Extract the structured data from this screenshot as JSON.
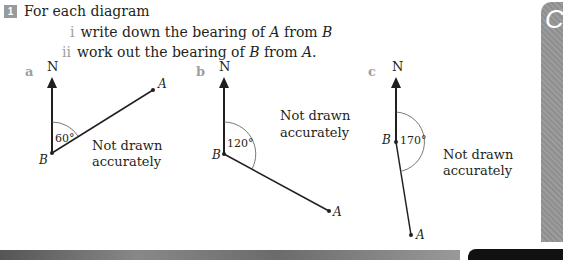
{
  "question": {
    "number": "1",
    "intro": "For each diagram",
    "parts": [
      {
        "label": "i",
        "text_before": "write down the bearing of ",
        "var1": "A",
        "text_mid": " from ",
        "var2": "B",
        "text_after": ""
      },
      {
        "label": "ii",
        "text_before": "work out the bearing of ",
        "var1": "B",
        "text_mid": " from ",
        "var2": "A",
        "text_after": "."
      }
    ]
  },
  "diagrams": [
    {
      "label": "a",
      "north": "N",
      "angle": "60°",
      "point_b": "B",
      "point_a": "A",
      "note_line1": "Not drawn",
      "note_line2": "accurately"
    },
    {
      "label": "b",
      "north": "N",
      "angle": "120°",
      "point_b": "B",
      "point_a": "A",
      "note_line1": "Not drawn",
      "note_line2": "accurately"
    },
    {
      "label": "c",
      "north": "N",
      "angle": "170°",
      "point_b": "B",
      "point_a": "A",
      "note_line1": "Not drawn",
      "note_line2": "accurately"
    }
  ],
  "side_tab": {
    "letter": "C"
  }
}
